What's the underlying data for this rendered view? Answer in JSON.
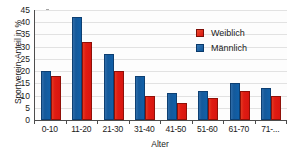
{
  "chart_data": {
    "type": "bar",
    "title": "",
    "xlabel": "Alter",
    "ylabel": "Sportverein-Anteil in %",
    "ylim": [
      0,
      45
    ],
    "yticks": [
      0,
      5,
      10,
      15,
      20,
      25,
      30,
      35,
      40,
      45
    ],
    "grid": true,
    "legend_position": "top-right",
    "categories": [
      "0-10",
      "11-20",
      "21-30",
      "31-40",
      "41-50",
      "51-60",
      "61-70",
      "71-..."
    ],
    "series": [
      {
        "name": "Männlich",
        "color": "#14599b",
        "values": [
          20,
          42,
          27,
          18,
          11,
          12,
          15,
          13
        ]
      },
      {
        "name": "Weiblich",
        "color": "#d81610",
        "values": [
          18,
          32,
          20,
          10,
          7,
          9,
          12,
          10
        ]
      }
    ],
    "legend": [
      {
        "label": "Weiblich",
        "color": "#d81610"
      },
      {
        "label": "Männlich",
        "color": "#14599b"
      }
    ]
  }
}
